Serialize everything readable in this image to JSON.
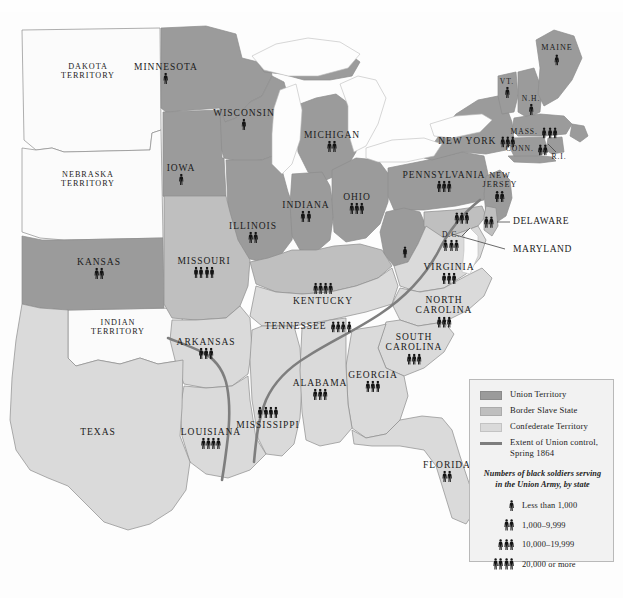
{
  "map": {
    "title": "Numbers of black soldiers serving in the Union Army, by state",
    "colors": {
      "union_territory": "#9b9b9b",
      "border_slave_state": "#bfbfbf",
      "confederate_territory": "#dadada",
      "unorganized_territory": "#fbfbfb",
      "water": "#fdfdfd",
      "union_control_line": "#7e7e7e",
      "state_border": "#8d8d8d",
      "label_text": "#1b1b1b",
      "legend_background": "#f2f2f2",
      "legend_border": "#b9b9b9"
    }
  },
  "legend": {
    "entries": [
      {
        "label": "Union Territory",
        "swatch": "#9b9b9b",
        "type": "swatch"
      },
      {
        "label": "Border Slave State",
        "swatch": "#bfbfbf",
        "type": "swatch"
      },
      {
        "label": "Confederate Territory",
        "swatch": "#dadada",
        "type": "swatch"
      },
      {
        "label": "Extent of Union control,\nSpring 1864",
        "swatch": "#7e7e7e",
        "type": "line"
      }
    ],
    "scale_heading": "Numbers of black soldiers serving\nin the Union Army, by state",
    "scale": [
      {
        "figures": 1,
        "label": "Less than 1,000"
      },
      {
        "figures": 2,
        "label": "1,000–9,999"
      },
      {
        "figures": 3,
        "label": "10,000–19,999"
      },
      {
        "figures": 4,
        "label": "20,000 or more"
      }
    ]
  },
  "regions": [
    {
      "name": "DAKOTA TERRITORY",
      "label": "DAKOTA\nTERRITORY",
      "figures": 0,
      "category": "unorganized_territory",
      "x": 88,
      "y": 72,
      "size": "sm"
    },
    {
      "name": "NEBRASKA TERRITORY",
      "label": "NEBRASKA\nTERRITORY",
      "figures": 0,
      "category": "unorganized_territory",
      "x": 88,
      "y": 180,
      "size": "sm"
    },
    {
      "name": "INDIAN TERRITORY",
      "label": "INDIAN\nTERRITORY",
      "figures": 0,
      "category": "unorganized_territory",
      "x": 118,
      "y": 328,
      "size": "sm"
    },
    {
      "name": "MINNESOTA",
      "label": "MINNESOTA",
      "figures": 1,
      "category": "union_territory",
      "x": 166,
      "y": 73,
      "size": ""
    },
    {
      "name": "WISCONSIN",
      "label": "WISCONSIN",
      "figures": 1,
      "category": "union_territory",
      "x": 244,
      "y": 119,
      "size": ""
    },
    {
      "name": "MICHIGAN",
      "label": "MICHIGAN",
      "figures": 2,
      "category": "union_territory",
      "x": 332,
      "y": 141,
      "size": ""
    },
    {
      "name": "IOWA",
      "label": "IOWA",
      "figures": 1,
      "category": "union_territory",
      "x": 181,
      "y": 174,
      "size": ""
    },
    {
      "name": "ILLINOIS",
      "label": "ILLINOIS",
      "figures": 2,
      "category": "union_territory",
      "x": 253,
      "y": 232,
      "size": ""
    },
    {
      "name": "INDIANA",
      "label": "INDIANA",
      "figures": 2,
      "category": "union_territory",
      "x": 306,
      "y": 211,
      "size": ""
    },
    {
      "name": "OHIO",
      "label": "OHIO",
      "figures": 3,
      "category": "union_territory",
      "x": 357,
      "y": 203,
      "size": ""
    },
    {
      "name": "KANSAS",
      "label": "KANSAS",
      "figures": 2,
      "category": "union_territory",
      "x": 99,
      "y": 268,
      "size": ""
    },
    {
      "name": "MISSOURI",
      "label": "MISSOURI",
      "figures": 4,
      "category": "border_slave_state",
      "x": 204,
      "y": 267,
      "size": ""
    },
    {
      "name": "KENTUCKY",
      "label": "KENTUCKY",
      "figures": 4,
      "category": "border_slave_state",
      "x": 323,
      "y": 294,
      "size": "",
      "figures_above": true
    },
    {
      "name": "PENNSYLVANIA",
      "label": "PENNSYLVANIA",
      "figures": 3,
      "category": "union_territory",
      "x": 444,
      "y": 181,
      "size": ""
    },
    {
      "name": "NEW YORK",
      "label": "NEW YORK",
      "figures": 3,
      "category": "union_territory",
      "x": 477,
      "y": 140,
      "size": "",
      "inline": true
    },
    {
      "name": "VERMONT",
      "label": "VT.",
      "figures": 1,
      "category": "union_territory",
      "x": 507,
      "y": 88,
      "size": "xs"
    },
    {
      "name": "NEW HAMPSHIRE",
      "label": "N.H.",
      "figures": 1,
      "category": "union_territory",
      "x": 531,
      "y": 105,
      "size": "xs"
    },
    {
      "name": "MAINE",
      "label": "MAINE",
      "figures": 1,
      "category": "union_territory",
      "x": 557,
      "y": 55,
      "size": "sm"
    },
    {
      "name": "MASSACHUSETTS",
      "label": "MASS.",
      "figures": 3,
      "category": "union_territory",
      "x": 534,
      "y": 131,
      "size": "xs",
      "inline": true
    },
    {
      "name": "CONNECTICUT",
      "label": "CONN.",
      "figures": 2,
      "category": "union_territory",
      "x": 527,
      "y": 148,
      "size": "xs",
      "inline": true
    },
    {
      "name": "RHODE ISLAND",
      "label": "R.I.",
      "figures": 0,
      "category": "union_territory",
      "x": 559,
      "y": 157,
      "size": "xs"
    },
    {
      "name": "NEW JERSEY",
      "label": "NEW\nJERSEY",
      "figures": 2,
      "category": "union_territory",
      "x": 500,
      "y": 187,
      "size": "sm"
    },
    {
      "name": "DISTRICT OF COLUMBIA",
      "label": "D.C.",
      "figures": 3,
      "category": "border_slave_state",
      "x": 451,
      "y": 241,
      "size": "xs"
    },
    {
      "name": "VIRGINIA",
      "label": "VIRGINIA",
      "figures": 3,
      "category": "confederate_territory",
      "x": 449,
      "y": 273,
      "size": ""
    },
    {
      "name": "NORTH CAROLINA",
      "label": "NORTH\nCAROLINA",
      "figures": 3,
      "category": "confederate_territory",
      "x": 444,
      "y": 311,
      "size": ""
    },
    {
      "name": "SOUTH CAROLINA",
      "label": "SOUTH\nCAROLINA",
      "figures": 3,
      "category": "confederate_territory",
      "x": 414,
      "y": 348,
      "size": ""
    },
    {
      "name": "TENNESSEE",
      "label": "TENNESSEE",
      "figures": 4,
      "category": "confederate_territory",
      "x": 308,
      "y": 325,
      "size": "",
      "inline": true
    },
    {
      "name": "ARKANSAS",
      "label": "ARKANSAS",
      "figures": 3,
      "category": "confederate_territory",
      "x": 206,
      "y": 348,
      "size": ""
    },
    {
      "name": "ALABAMA",
      "label": "ALABAMA",
      "figures": 3,
      "category": "confederate_territory",
      "x": 320,
      "y": 389,
      "size": ""
    },
    {
      "name": "GEORGIA",
      "label": "GEORGIA",
      "figures": 3,
      "category": "confederate_territory",
      "x": 373,
      "y": 381,
      "size": ""
    },
    {
      "name": "MISSISSIPPI",
      "label": "MISSISSIPPI",
      "figures": 4,
      "category": "confederate_territory",
      "x": 268,
      "y": 418,
      "size": "",
      "figures_above": true
    },
    {
      "name": "LOUISIANA",
      "label": "LOUISIANA",
      "figures": 4,
      "category": "confederate_territory",
      "x": 211,
      "y": 438,
      "size": ""
    },
    {
      "name": "TEXAS",
      "label": "TEXAS",
      "figures": 0,
      "category": "confederate_territory",
      "x": 98,
      "y": 432,
      "size": ""
    },
    {
      "name": "FLORIDA",
      "label": "FLORIDA",
      "figures": 2,
      "category": "confederate_territory",
      "x": 447,
      "y": 471,
      "size": ""
    },
    {
      "name": "WEST VIRGINIA",
      "label": "",
      "figures": 1,
      "category": "union_territory",
      "x": 405,
      "y": 252,
      "size": ""
    }
  ],
  "callouts": [
    {
      "label": "DELAWARE",
      "x": 513,
      "y": 222,
      "figures": 2
    },
    {
      "label": "MARYLAND",
      "x": 513,
      "y": 250,
      "figures": 3
    }
  ]
}
